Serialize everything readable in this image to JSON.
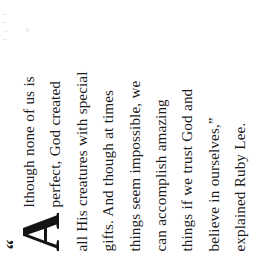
{
  "document": {
    "type": "scanned-page-pull-quote",
    "rotation_degrees": -90,
    "background_color": "#ffffff",
    "text_color": "#1b1b1b"
  },
  "pullquote": {
    "open_quote": "“",
    "close_quote": "”",
    "dropcap": "A",
    "full_text": "“Although none of us is perfect, God created all His creatures with special gifts. And though at times things seem impossible, we can accomplish amazing things if we trust God and believe in ourselves,” explained Ruby Lee.",
    "lines": [
      "lthough none of us is",
      "perfect, God created",
      "all His creatures with special",
      "gifts. And though at times",
      "things seem impossible, we",
      "can accomplish amazing",
      "things if we trust God and",
      "believe in ourselves,”",
      "explained Ruby Lee."
    ],
    "attribution": "explained Ruby Lee.",
    "speaker": "Ruby Lee"
  }
}
